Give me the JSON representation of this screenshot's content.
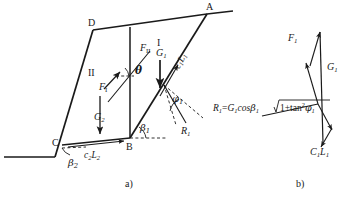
{
  "figure": {
    "caption_a": "a)",
    "caption_b": "b)"
  },
  "diagram_a": {
    "points": {
      "A": "A",
      "B": "B",
      "C": "C",
      "D": "D"
    },
    "regions": {
      "wedge_1": "I",
      "wedge_2": "II"
    },
    "forces": {
      "F_I": {
        "symbol": "F",
        "sub": "I"
      },
      "F_II": {
        "symbol": "F",
        "sub": "II"
      },
      "G1": {
        "symbol": "G",
        "sub": "1"
      },
      "G2": {
        "symbol": "G",
        "sub": "2"
      },
      "R1": {
        "symbol": "R",
        "sub": "1"
      },
      "c1L1": {
        "symbol": "c",
        "sub1": "1",
        "symbol2": "L",
        "sub2": "1"
      },
      "c2L2": {
        "symbol": "c",
        "sub1": "2",
        "symbol2": "L",
        "sub2": "2"
      }
    },
    "angles": {
      "theta": "θ",
      "beta1": {
        "symbol": "β",
        "sub": "1"
      },
      "beta2": {
        "symbol": "β",
        "sub": "2"
      },
      "phi1": {
        "symbol": "φ",
        "sub": "1"
      }
    }
  },
  "diagram_b": {
    "forces": {
      "F1": {
        "symbol": "F",
        "sub": "1"
      },
      "G1": {
        "symbol": "G",
        "sub": "1"
      },
      "C1L1": {
        "symbol": "C",
        "sub1": "1",
        "symbol2": "L",
        "sub2": "1"
      }
    },
    "equation": {
      "lhs_symbol": "R",
      "lhs_sub": "1",
      "eq": "=",
      "t1_symbol": "G",
      "t1_sub": "1",
      "cos": "cos",
      "beta": "β",
      "beta_sub": "1",
      "radicand_prefix": "1+tan",
      "radicand_exp": "2",
      "radicand_phi": "φ",
      "radicand_phi_sub": "1",
      "full_text": "R₁=G₁cosβ₁√(1+tan²φ₁)"
    }
  },
  "style": {
    "line_color": "#1a1a1a",
    "text_color": "#1a1a1a",
    "background": "#ffffff"
  }
}
